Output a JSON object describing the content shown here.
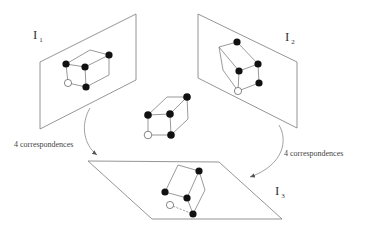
{
  "diagram": {
    "image_planes": [
      {
        "id": "I1",
        "label": "I",
        "subscript": "1"
      },
      {
        "id": "I2",
        "label": "I",
        "subscript": "2"
      },
      {
        "id": "I3",
        "label": "I",
        "subscript": "3"
      }
    ],
    "arrows": [
      {
        "from": "I1",
        "to": "I3",
        "label": "4 correspondences"
      },
      {
        "from": "I2",
        "to": "I3",
        "label": "4 correspondences"
      }
    ],
    "cube": {
      "filled_points": 4,
      "open_points": 1
    },
    "colors": {
      "lines": "#7a7a7a",
      "points": "#111111",
      "background": "#ffffff"
    }
  }
}
